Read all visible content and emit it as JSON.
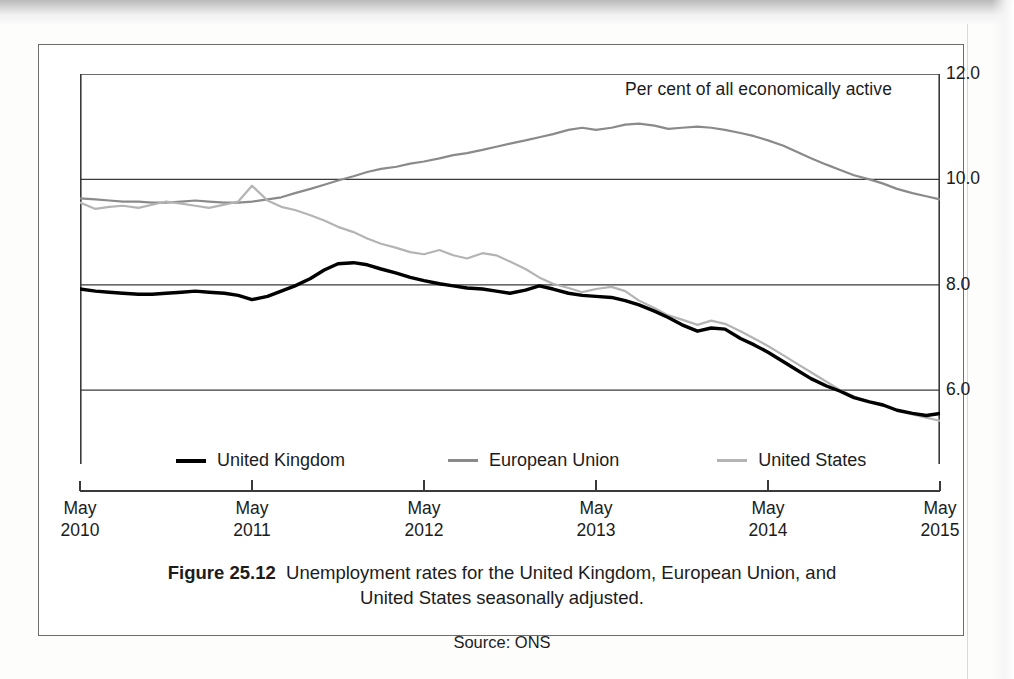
{
  "figure": {
    "number_label": "Figure 25.12",
    "caption_line1": "Unemployment rates for the United Kingdom, European Union, and",
    "caption_line2": "United States seasonally adjusted.",
    "source": "Source: ONS"
  },
  "colors": {
    "uk": "#000000",
    "eu": "#8a8a8a",
    "us": "#b4b4b4",
    "gridline": "#3a3a3a",
    "axis": "#3a3a3a",
    "frame": "#6e6e6e",
    "text": "#1c1c1c",
    "background": "#ffffff"
  },
  "legend": {
    "position": "inside-bottom",
    "entries": [
      {
        "label": "United Kingdom",
        "swatch": "uk"
      },
      {
        "label": "European Union",
        "swatch": "eu"
      },
      {
        "label": "United States",
        "swatch": "us"
      }
    ]
  },
  "chart_data": {
    "type": "line",
    "title": "Unemployment rates for the United Kingdom, European Union, and United States seasonally adjusted.",
    "subtitle": "",
    "unit_label": "Per cent of all economically active",
    "xlabel": "",
    "ylabel": "Per cent of all economically active",
    "ylim": [
      4.6,
      12.0
    ],
    "yticks": [
      "12.0",
      "10.0",
      "8.0",
      "6.0"
    ],
    "ytick_values": [
      12.0,
      10.0,
      8.0,
      6.0
    ],
    "grid": "horizontal",
    "xlim": [
      "May 2010",
      "May 2015"
    ],
    "xticks": [
      {
        "month": "May",
        "year": "2010"
      },
      {
        "month": "May",
        "year": "2011"
      },
      {
        "month": "May",
        "year": "2012"
      },
      {
        "month": "May",
        "year": "2013"
      },
      {
        "month": "May",
        "year": "2014"
      },
      {
        "month": "May",
        "year": "2015"
      }
    ],
    "x": [
      2010.33,
      2010.42,
      2010.5,
      2010.58,
      2010.67,
      2010.75,
      2010.83,
      2010.92,
      2011.0,
      2011.08,
      2011.17,
      2011.25,
      2011.33,
      2011.42,
      2011.5,
      2011.58,
      2011.67,
      2011.75,
      2011.83,
      2011.92,
      2012.0,
      2012.08,
      2012.17,
      2012.25,
      2012.33,
      2012.42,
      2012.5,
      2012.58,
      2012.67,
      2012.75,
      2012.83,
      2012.92,
      2013.0,
      2013.08,
      2013.17,
      2013.25,
      2013.33,
      2013.42,
      2013.5,
      2013.58,
      2013.67,
      2013.75,
      2013.83,
      2013.92,
      2014.0,
      2014.08,
      2014.17,
      2014.25,
      2014.33,
      2014.42,
      2014.5,
      2014.58,
      2014.67,
      2014.75,
      2014.83,
      2014.92,
      2015.0,
      2015.08,
      2015.17,
      2015.25,
      2015.33
    ],
    "series": [
      {
        "name": "United Kingdom",
        "color": "#000000",
        "width": 3.4,
        "values": [
          7.92,
          7.88,
          7.86,
          7.84,
          7.82,
          7.82,
          7.84,
          7.86,
          7.88,
          7.86,
          7.84,
          7.8,
          7.72,
          7.78,
          7.88,
          7.98,
          8.12,
          8.28,
          8.4,
          8.42,
          8.38,
          8.3,
          8.22,
          8.14,
          8.08,
          8.02,
          7.98,
          7.94,
          7.92,
          7.88,
          7.84,
          7.9,
          7.98,
          7.92,
          7.84,
          7.8,
          7.78,
          7.76,
          7.7,
          7.62,
          7.5,
          7.38,
          7.24,
          7.12,
          7.18,
          7.16,
          6.98,
          6.86,
          6.72,
          6.54,
          6.38,
          6.22,
          6.08,
          5.98,
          5.86,
          5.78,
          5.72,
          5.62,
          5.56,
          5.52,
          5.56
        ]
      },
      {
        "name": "European Union",
        "color": "#8a8a8a",
        "width": 2.2,
        "values": [
          9.64,
          9.62,
          9.6,
          9.58,
          9.58,
          9.56,
          9.56,
          9.58,
          9.6,
          9.58,
          9.56,
          9.56,
          9.58,
          9.62,
          9.66,
          9.74,
          9.82,
          9.9,
          9.98,
          10.06,
          10.14,
          10.2,
          10.24,
          10.3,
          10.34,
          10.4,
          10.46,
          10.5,
          10.56,
          10.62,
          10.68,
          10.74,
          10.8,
          10.86,
          10.94,
          10.98,
          10.94,
          10.98,
          11.04,
          11.06,
          11.02,
          10.96,
          10.98,
          11.0,
          10.98,
          10.94,
          10.88,
          10.82,
          10.74,
          10.64,
          10.52,
          10.4,
          10.28,
          10.18,
          10.08,
          10.0,
          9.92,
          9.82,
          9.74,
          9.68,
          9.62
        ]
      },
      {
        "name": "United States",
        "color": "#b4b4b4",
        "width": 2.2,
        "values": [
          9.56,
          9.44,
          9.48,
          9.5,
          9.46,
          9.52,
          9.58,
          9.54,
          9.5,
          9.46,
          9.52,
          9.58,
          9.88,
          9.6,
          9.48,
          9.42,
          9.32,
          9.22,
          9.1,
          9.0,
          8.88,
          8.78,
          8.7,
          8.62,
          8.58,
          8.66,
          8.56,
          8.5,
          8.6,
          8.56,
          8.44,
          8.3,
          8.14,
          8.02,
          7.94,
          7.86,
          7.92,
          7.96,
          7.88,
          7.7,
          7.56,
          7.42,
          7.34,
          7.24,
          7.32,
          7.26,
          7.12,
          6.98,
          6.84,
          6.66,
          6.5,
          6.34,
          6.16,
          6.0,
          5.88,
          5.78,
          5.7,
          5.62,
          5.54,
          5.48,
          5.42
        ]
      }
    ],
    "notes": {
      "uk_peak": "8.4 around late 2011 / early 2012",
      "eu_peak": "~11.05 around mid 2013",
      "us_spike": "~9.9 around May 2011",
      "end_values": "UK ~5.6, EU ~9.6, US ~5.4 at May 2015"
    }
  }
}
